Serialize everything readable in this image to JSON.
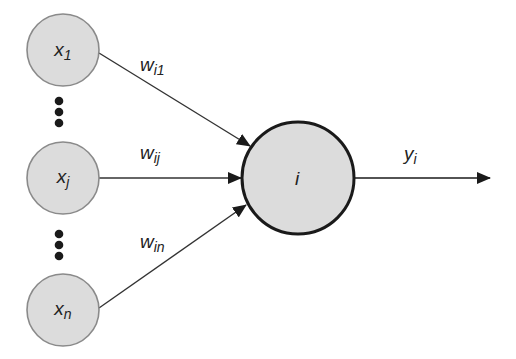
{
  "diagram": {
    "type": "neuron-model",
    "colors": {
      "node_fill": "#dcdcdc",
      "input_stroke": "#8a8a8a",
      "neuron_stroke": "#1a1a1a",
      "edge": "#333333",
      "text": "#222222"
    },
    "inputs": [
      {
        "id": "x1",
        "base": "x",
        "sub": "1",
        "cx": 63,
        "cy": 50
      },
      {
        "id": "xj",
        "base": "x",
        "sub": "j",
        "cx": 63,
        "cy": 178
      },
      {
        "id": "xn",
        "base": "x",
        "sub": "n",
        "cx": 63,
        "cy": 310
      }
    ],
    "ellipses": [
      {
        "id": "dots-upper",
        "cx": 59,
        "y": [
          101,
          112,
          123
        ]
      },
      {
        "id": "dots-lower",
        "cx": 59,
        "y": [
          234,
          245,
          256
        ]
      }
    ],
    "weights": [
      {
        "id": "w_i1",
        "base": "w",
        "sub": "i1",
        "x": 140,
        "y": 55
      },
      {
        "id": "w_ij",
        "base": "w",
        "sub": "ij",
        "x": 140,
        "y": 143
      },
      {
        "id": "w_in",
        "base": "w",
        "sub": "in",
        "x": 140,
        "y": 232
      }
    ],
    "neuron": {
      "label": "i",
      "cx": 298,
      "cy": 178,
      "r": 56
    },
    "output": {
      "base": "y",
      "sub": "i",
      "x": 404,
      "y": 144
    }
  }
}
